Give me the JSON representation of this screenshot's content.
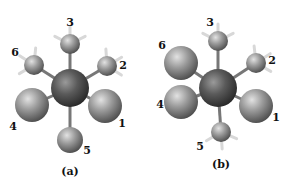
{
  "figure": {
    "panels": [
      {
        "caption": "(a)",
        "center_atom": {
          "x": 70,
          "y": 88,
          "r": 19
        },
        "ligands": [
          {
            "label": "1",
            "size": "large",
            "x": 105,
            "y": 106,
            "r": 17,
            "lx": 122,
            "ly": 127,
            "h": false
          },
          {
            "label": "2",
            "size": "small",
            "x": 107,
            "y": 66,
            "r": 10,
            "lx": 123,
            "ly": 69,
            "h": true
          },
          {
            "label": "3",
            "size": "small",
            "x": 70,
            "y": 44,
            "r": 10,
            "lx": 70,
            "ly": 26,
            "h": true
          },
          {
            "label": "4",
            "size": "large",
            "x": 32,
            "y": 105,
            "r": 17,
            "lx": 13,
            "ly": 130,
            "h": false
          },
          {
            "label": "5",
            "size": "medium",
            "x": 70,
            "y": 140,
            "r": 13,
            "lx": 87,
            "ly": 154,
            "h": false
          },
          {
            "label": "6",
            "size": "small",
            "x": 34,
            "y": 65,
            "r": 10,
            "lx": 15,
            "ly": 56,
            "h": true
          }
        ],
        "caption_pos": {
          "x": 70,
          "y": 175
        }
      },
      {
        "caption": "(b)",
        "center_atom": {
          "x": 218,
          "y": 88,
          "r": 19
        },
        "ligands": [
          {
            "label": "1",
            "size": "large",
            "x": 256,
            "y": 106,
            "r": 17,
            "lx": 276,
            "ly": 121,
            "h": false
          },
          {
            "label": "2",
            "size": "small",
            "x": 256,
            "y": 63,
            "r": 10,
            "lx": 272,
            "ly": 64,
            "h": true
          },
          {
            "label": "3",
            "size": "small",
            "x": 218,
            "y": 41,
            "r": 10,
            "lx": 210,
            "ly": 26,
            "h": true
          },
          {
            "label": "4",
            "size": "large",
            "x": 181,
            "y": 102,
            "r": 17,
            "lx": 160,
            "ly": 108,
            "h": false
          },
          {
            "label": "5",
            "size": "small",
            "x": 221,
            "y": 132,
            "r": 10,
            "lx": 200,
            "ly": 150,
            "h": true
          },
          {
            "label": "6",
            "size": "large",
            "x": 181,
            "y": 63,
            "r": 17,
            "lx": 162,
            "ly": 49,
            "h": false
          }
        ],
        "caption_pos": {
          "x": 221,
          "y": 168
        }
      }
    ],
    "colors": {
      "background": "#ffffff",
      "center_atom": "#4a4a4a",
      "ligand": "#8c8c8c",
      "hydrogen": "#d8d8d8",
      "bond": "#777777",
      "label": "#111111"
    }
  }
}
